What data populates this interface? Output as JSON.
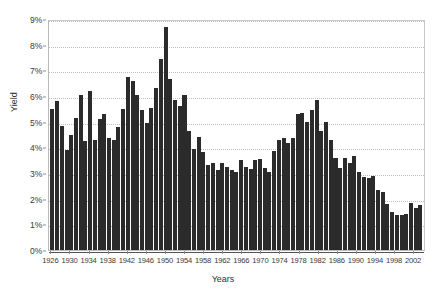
{
  "chart_data": {
    "type": "bar",
    "title": "",
    "xlabel": "Years",
    "ylabel": "Yield",
    "ylim": [
      0,
      9
    ],
    "ytick_labels": [
      "0%",
      "1%",
      "2%",
      "3%",
      "4%",
      "5%",
      "6%",
      "7%",
      "8%",
      "9%"
    ],
    "ytick_values": [
      0,
      1,
      2,
      3,
      4,
      5,
      6,
      7,
      8,
      9
    ],
    "xtick_labels": [
      "1926",
      "1930",
      "1934",
      "1938",
      "1942",
      "1946",
      "1950",
      "1954",
      "1958",
      "1962",
      "1966",
      "1970",
      "1974",
      "1978",
      "1982",
      "1986",
      "1990",
      "1994",
      "1998",
      "2002"
    ],
    "grid": "horizontal-dotted",
    "legend": "none",
    "bar_color": "#2b2b2b",
    "categories": [
      "1926",
      "1927",
      "1928",
      "1929",
      "1930",
      "1931",
      "1932",
      "1933",
      "1934",
      "1935",
      "1936",
      "1937",
      "1938",
      "1939",
      "1940",
      "1941",
      "1942",
      "1943",
      "1944",
      "1945",
      "1946",
      "1947",
      "1948",
      "1949",
      "1950",
      "1951",
      "1952",
      "1953",
      "1954",
      "1955",
      "1956",
      "1957",
      "1958",
      "1959",
      "1960",
      "1961",
      "1962",
      "1963",
      "1964",
      "1965",
      "1966",
      "1967",
      "1968",
      "1969",
      "1970",
      "1971",
      "1972",
      "1973",
      "1974",
      "1975",
      "1976",
      "1977",
      "1978",
      "1979",
      "1980",
      "1981",
      "1982",
      "1983",
      "1984",
      "1985",
      "1986",
      "1987",
      "1988",
      "1989",
      "1990",
      "1991",
      "1992",
      "1993",
      "1994",
      "1995",
      "1996",
      "1997",
      "1998",
      "1999",
      "2000",
      "2001",
      "2002",
      "2003",
      "2004"
    ],
    "values": [
      5.5,
      5.8,
      4.85,
      3.9,
      4.5,
      5.15,
      6.05,
      4.25,
      6.2,
      4.3,
      5.1,
      5.3,
      4.35,
      4.3,
      4.8,
      5.5,
      6.75,
      6.6,
      6.05,
      5.45,
      4.95,
      5.55,
      6.3,
      7.45,
      8.7,
      6.65,
      5.85,
      5.6,
      6.05,
      4.65,
      3.95,
      4.4,
      3.8,
      3.3,
      3.4,
      3.1,
      3.4,
      3.25,
      3.1,
      3.05,
      3.5,
      3.25,
      3.15,
      3.5,
      3.55,
      3.2,
      3.05,
      3.85,
      4.3,
      4.35,
      4.15,
      4.35,
      5.3,
      5.35,
      5.0,
      5.45,
      5.85,
      4.65,
      5.0,
      4.3,
      3.6,
      3.2,
      3.6,
      3.4,
      3.65,
      3.05,
      2.85,
      2.8,
      2.9,
      2.35,
      2.25,
      1.8,
      1.5,
      1.35,
      1.35,
      1.4,
      1.85,
      1.65,
      1.75
    ]
  }
}
